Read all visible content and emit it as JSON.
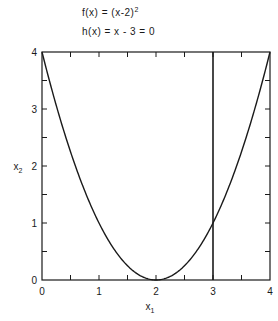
{
  "equations": {
    "objective_prefix": "f(x) = (x-2)",
    "objective_exp": "2",
    "constraint": "h(x) = x - 3 = 0"
  },
  "axes": {
    "xlabel_main": "x",
    "xlabel_sub": "1",
    "ylabel_main": "x",
    "ylabel_sub": "2",
    "x_ticks": [
      "0",
      "1",
      "2",
      "3",
      "4"
    ],
    "y_ticks": [
      "0",
      "1",
      "2",
      "3",
      "4"
    ]
  },
  "chart_data": {
    "type": "line",
    "title": "",
    "annotations": [
      "f(x) = (x-2)^2",
      "h(x) = x - 3 = 0"
    ],
    "xlabel": "x1",
    "ylabel": "x2",
    "xlim": [
      0,
      4
    ],
    "ylim": [
      0,
      4
    ],
    "grid": false,
    "x_major_ticks": [
      0,
      1,
      2,
      3,
      4
    ],
    "x_minor_ticks": [
      0.5,
      1.5,
      2.5,
      3.5
    ],
    "y_major_ticks": [
      0,
      1,
      2,
      3,
      4
    ],
    "y_minor_ticks": [
      0.5,
      1.5,
      2.5,
      3.5
    ],
    "series": [
      {
        "name": "f(x) = (x-2)^2",
        "x": [
          0,
          0.5,
          1,
          1.5,
          2,
          2.5,
          3,
          3.5,
          4
        ],
        "y": [
          4,
          2.25,
          1,
          0.25,
          0,
          0.25,
          1,
          2.25,
          4
        ]
      },
      {
        "name": "h(x) = x - 3 = 0",
        "x": [
          3,
          3
        ],
        "y": [
          0,
          4
        ]
      }
    ]
  }
}
